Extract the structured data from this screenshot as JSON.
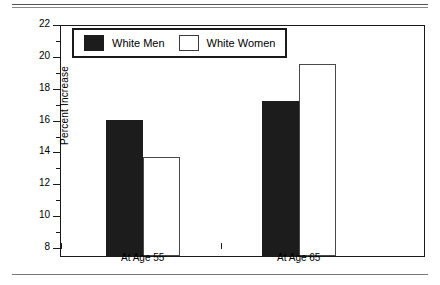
{
  "chart_data": {
    "type": "bar",
    "title": "",
    "subtitle": "",
    "xlabel": "",
    "ylabel": "Percent Increase",
    "categories": [
      "At Age 55",
      "At Age 65"
    ],
    "series": [
      {
        "name": "White Men",
        "values": [
          16.6,
          17.8
        ],
        "fill": "#1c1c1c",
        "style": "filled"
      },
      {
        "name": "White Women",
        "values": [
          14.3,
          20.1
        ],
        "fill": "#ffffff",
        "style": "hollow"
      }
    ],
    "ylim": [
      8,
      22
    ],
    "ymajor_ticks": [
      8,
      10,
      12,
      14,
      16,
      18,
      20,
      22
    ],
    "yminor_ticks": [
      9,
      11,
      13,
      15,
      17,
      19,
      21
    ],
    "ytick_labels": [
      "8",
      "10",
      "12",
      "14",
      "16",
      "18",
      "20",
      "22"
    ],
    "grid": false,
    "legend_position": "top-left-inside",
    "legend_entries": [
      "White Men",
      "White Women"
    ],
    "frame": true,
    "axis_color": "#1a1a1a"
  },
  "axes": {
    "y_title": "Percent Increase",
    "y_ticks": [
      {
        "value": 22,
        "label": "22",
        "major": true
      },
      {
        "value": 21,
        "label": "",
        "major": false
      },
      {
        "value": 20,
        "label": "20",
        "major": true
      },
      {
        "value": 19,
        "label": "",
        "major": false
      },
      {
        "value": 18,
        "label": "18",
        "major": true
      },
      {
        "value": 17,
        "label": "",
        "major": false
      },
      {
        "value": 16,
        "label": "16",
        "major": true
      },
      {
        "value": 15,
        "label": "",
        "major": false
      },
      {
        "value": 14,
        "label": "14",
        "major": true
      },
      {
        "value": 13,
        "label": "",
        "major": false
      },
      {
        "value": 12,
        "label": "12",
        "major": true
      },
      {
        "value": 11,
        "label": "",
        "major": false
      },
      {
        "value": 10,
        "label": "10",
        "major": true
      },
      {
        "value": 9,
        "label": "",
        "major": false
      },
      {
        "value": 8,
        "label": "8",
        "major": true
      }
    ],
    "x_labels": [
      "At Age 55",
      "At Age 65"
    ]
  },
  "legend": {
    "items": [
      {
        "label": "White Men",
        "style": "filled"
      },
      {
        "label": "White Women",
        "style": "hollow"
      }
    ]
  }
}
